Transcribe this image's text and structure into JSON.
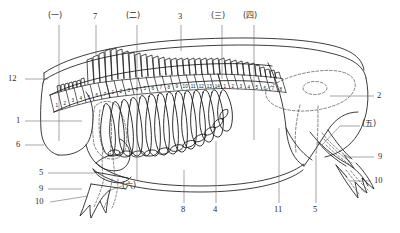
{
  "figure": {
    "type": "anatomical-line-drawing",
    "stroke_color": "#1a1a1a",
    "dashed_color": "#4a4a4a",
    "leader_color": "#555555",
    "background": "#ffffff",
    "width": 400,
    "height": 233
  },
  "callouts": {
    "top": [
      {
        "id": "c-cn-1",
        "text": "(一)",
        "x": 48,
        "y": 14,
        "leader": {
          "x1": 59,
          "y1": 24,
          "x2": 59,
          "y2": 141
        }
      },
      {
        "id": "c-7",
        "text": "7",
        "x": 93,
        "y": 14,
        "leader": {
          "x1": 96,
          "y1": 24,
          "x2": 96,
          "y2": 54
        }
      },
      {
        "id": "c-cn-2",
        "text": "(二)",
        "x": 126,
        "y": 14,
        "leader": {
          "x1": 137,
          "y1": 24,
          "x2": 137,
          "y2": 157
        }
      },
      {
        "id": "c-3",
        "text": "3",
        "x": 178,
        "y": 14,
        "leader": {
          "x1": 181,
          "y1": 24,
          "x2": 181,
          "y2": 50
        }
      },
      {
        "id": "c-cn-3",
        "text": "(三)",
        "x": 211,
        "y": 14,
        "leader": {
          "x1": 222,
          "y1": 24,
          "x2": 222,
          "y2": 78
        }
      },
      {
        "id": "c-cn-4",
        "text": "(四)",
        "x": 243,
        "y": 14,
        "leader": {
          "x1": 254,
          "y1": 24,
          "x2": 254,
          "y2": 140
        }
      }
    ],
    "left": [
      {
        "id": "c-12",
        "text": "12",
        "x": 8,
        "y": 76,
        "leader": {
          "x1": 24,
          "y1": 79,
          "x2": 48,
          "y2": 79
        }
      },
      {
        "id": "c-1",
        "text": "1",
        "x": 17,
        "y": 118,
        "leader": {
          "x1": 24,
          "y1": 121,
          "x2": 82,
          "y2": 121
        }
      },
      {
        "id": "c-6",
        "text": "6",
        "x": 17,
        "y": 142,
        "leader": {
          "x1": 24,
          "y1": 145,
          "x2": 46,
          "y2": 145
        }
      },
      {
        "id": "c-5L",
        "text": "5",
        "x": 40,
        "y": 170,
        "leader": {
          "x1": 48,
          "y1": 173,
          "x2": 93,
          "y2": 173
        }
      },
      {
        "id": "c-9L",
        "text": "9",
        "x": 40,
        "y": 186,
        "leader": {
          "x1": 48,
          "y1": 189,
          "x2": 80,
          "y2": 189
        }
      },
      {
        "id": "c-10L",
        "text": "10",
        "x": 36,
        "y": 201,
        "leader": {
          "x1": 50,
          "y1": 204,
          "x2": 78,
          "y2": 200
        }
      }
    ],
    "right": [
      {
        "id": "c-2",
        "text": "2",
        "x": 377,
        "y": 93,
        "leader": {
          "x1": 330,
          "y1": 96,
          "x2": 374,
          "y2": 96
        }
      },
      {
        "id": "c-cn-5",
        "text": "(五)",
        "x": 363,
        "y": 122,
        "leader": {
          "x1": 340,
          "y1": 126,
          "x2": 361,
          "y2": 126
        }
      },
      {
        "id": "c-9R",
        "text": "9",
        "x": 378,
        "y": 154,
        "leader": {
          "x1": 355,
          "y1": 157,
          "x2": 375,
          "y2": 157
        }
      },
      {
        "id": "c-10R",
        "text": "10",
        "x": 375,
        "y": 178,
        "leader": {
          "x1": 352,
          "y1": 181,
          "x2": 372,
          "y2": 181
        }
      }
    ],
    "bottom": [
      {
        "id": "c-cn-6",
        "text": "(六)",
        "x": 124,
        "y": 186,
        "leader": {
          "x1": 137,
          "y1": 181,
          "x2": 137,
          "y2": 157
        }
      },
      {
        "id": "c-8",
        "text": "8",
        "x": 181,
        "y": 206,
        "leader": {
          "x1": 184,
          "y1": 204,
          "x2": 184,
          "y2": 170
        }
      },
      {
        "id": "c-4",
        "text": "4",
        "x": 213,
        "y": 206,
        "leader": {
          "x1": 216,
          "y1": 204,
          "x2": 216,
          "y2": 141
        }
      },
      {
        "id": "c-11",
        "text": "11",
        "x": 275,
        "y": 206,
        "leader": {
          "x1": 279,
          "y1": 204,
          "x2": 279,
          "y2": 128
        }
      },
      {
        "id": "c-5R",
        "text": "5",
        "x": 313,
        "y": 206,
        "leader": {
          "x1": 316,
          "y1": 204,
          "x2": 316,
          "y2": 155
        }
      }
    ]
  },
  "vertebrae": {
    "cervical": {
      "name": "cervical-vertebrae-row",
      "numbers": [
        "1",
        "2",
        "3",
        "4",
        "5",
        "6",
        "7"
      ]
    },
    "thoracic": {
      "name": "thoracic-vertebrae-row",
      "numbers": [
        "1",
        "2",
        "3",
        "4",
        "5",
        "6",
        "7",
        "8",
        "9",
        "10",
        "11",
        "12",
        "13",
        "14"
      ]
    },
    "lumbar": {
      "name": "lumbar-vertebrae-row",
      "numbers": [
        "1",
        "2",
        "3",
        "4",
        "5",
        "6",
        "7",
        "8"
      ]
    }
  }
}
